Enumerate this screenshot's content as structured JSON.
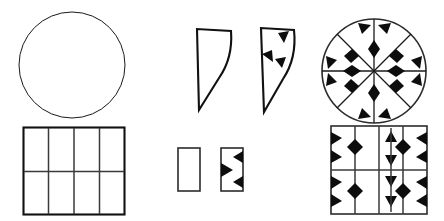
{
  "page": {
    "background_color": "#ffffff",
    "ink_color": "#0d0d0d",
    "width": 444,
    "height": 221
  },
  "figures": [
    {
      "id": "circle-plain",
      "name": "plain-circle",
      "label": "Plain circle",
      "shape": "circle",
      "pattern": "none",
      "stroke_color": "#1a1a1a",
      "fill_color": "none",
      "geometry": {
        "cx": 54,
        "cy": 54,
        "r": 53
      }
    },
    {
      "id": "square-plain",
      "name": "plain-square-grid",
      "label": "Plain square divided into 8 cells",
      "shape": "square",
      "pattern": "grid",
      "stroke_color": "#3a3a3a",
      "fill_color": "none",
      "geometry": {
        "width": 101,
        "height": 87,
        "columns": 4,
        "rows": 2
      }
    },
    {
      "id": "sector-plain",
      "name": "plain-sector",
      "label": "Plain circular sector",
      "shape": "sector",
      "pattern": "none",
      "stroke_color": "#111111",
      "fill_color": "none",
      "geometry": {
        "width": 44,
        "height": 82,
        "apex": [
          6,
          82
        ],
        "arc_radius": 80
      }
    },
    {
      "id": "sector-patterned",
      "name": "patterned-sector",
      "label": "Patterned circular sector",
      "shape": "sector",
      "pattern": "diamond-triangle",
      "stroke_color": "#111111",
      "fill_color": "none",
      "motif_count": 3,
      "geometry": {
        "width": 44,
        "height": 86,
        "apex": [
          6,
          86
        ],
        "arc_radius": 82
      }
    },
    {
      "id": "strip-plain",
      "name": "plain-rectangle-strip",
      "label": "Plain rectangular strip",
      "shape": "rectangle",
      "pattern": "none",
      "stroke_color": "#2b2b2b",
      "fill_color": "none",
      "geometry": {
        "width": 22,
        "height": 43
      }
    },
    {
      "id": "strip-patterned",
      "name": "patterned-rectangle-strip",
      "label": "Patterned rectangular strip",
      "shape": "rectangle",
      "pattern": "triangle-notch",
      "stroke_color": "#2b2b2b",
      "fill_color": "none",
      "motif_count": 3,
      "geometry": {
        "width": 22,
        "height": 43
      }
    },
    {
      "id": "circle-patterned",
      "name": "patterned-circle",
      "label": "Patterned circle with eight sectors",
      "shape": "circle",
      "pattern": "radial-diamond-star",
      "stroke_color": "#1a1a1a",
      "fill_color": "none",
      "sector_count": 8,
      "geometry": {
        "cx": 55,
        "cy": 53,
        "r": 53
      }
    },
    {
      "id": "square-patterned",
      "name": "patterned-square-grid",
      "label": "Patterned square divided into 8 cells",
      "shape": "square",
      "pattern": "diamond-triangle-grid",
      "stroke_color": "#3a3a3a",
      "fill_color": "none",
      "columns": 4,
      "rows": 2,
      "geometry": {
        "width": 96,
        "height": 88
      }
    }
  ]
}
